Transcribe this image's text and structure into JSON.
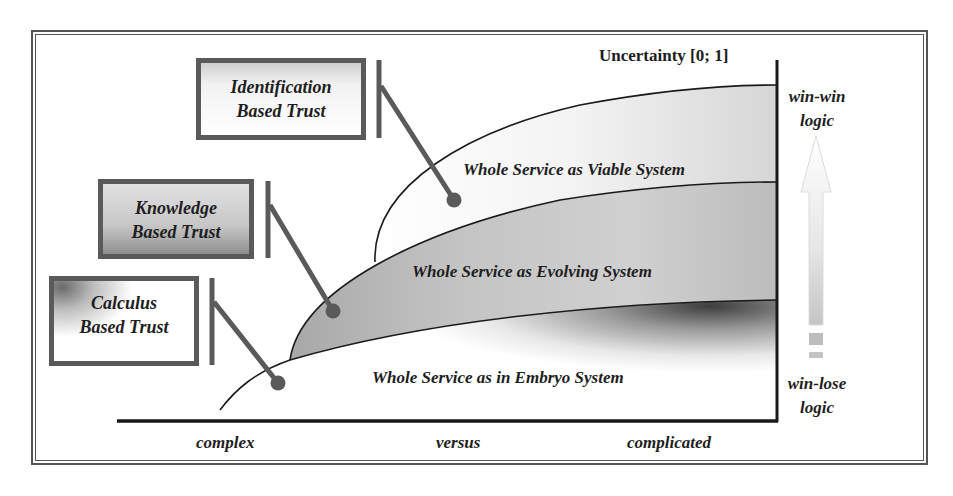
{
  "diagram": {
    "axis": {
      "y_title": "Uncertainty [0; 1]",
      "x_labels": [
        "complex",
        "versus",
        "complicated"
      ]
    },
    "regions": [
      {
        "label": "Whole Service as Viable System",
        "fill": "#e6e6e6"
      },
      {
        "label": "Whole Service as Evolving System",
        "fill": "#bdbdbd"
      },
      {
        "label": "Whole Service as in Embryo System",
        "fill": "#ffffff"
      }
    ],
    "trust_boxes": [
      {
        "line1": "Identification",
        "line2": "Based Trust",
        "points_to": "Whole Service as Viable System"
      },
      {
        "line1": "Knowledge",
        "line2": "Based Trust",
        "points_to": "Whole Service as Evolving System"
      },
      {
        "line1": "Calculus",
        "line2": "Based Trust",
        "points_to": "Whole Service as in Embryo System"
      }
    ],
    "logic_scale": {
      "top_line1": "win-win",
      "top_line2": "logic",
      "bottom_line1": "win-lose",
      "bottom_line2": "logic",
      "arrow_icon": "up-arrow-gradient"
    },
    "colors": {
      "frame": "#555555",
      "connector": "#5a5a5a",
      "curve": "#1a1a1a",
      "text": "#1e1e1e"
    }
  }
}
